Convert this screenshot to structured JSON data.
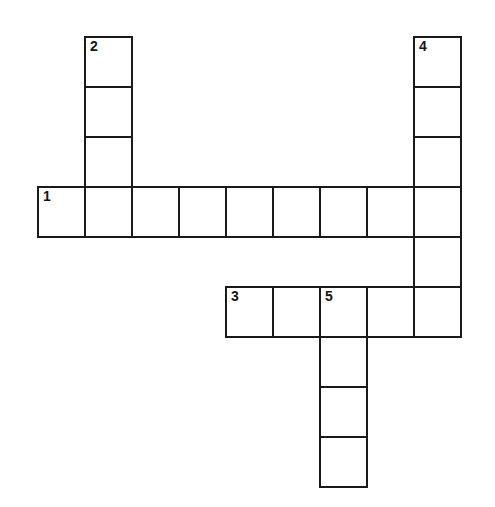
{
  "puzzle": {
    "title": "Crossword Grid",
    "background_color": "#ffffff",
    "cell_fill_color": "#ffffff",
    "cell_border_color": "#1a1a1a",
    "number_color": "#141414",
    "cell_width": 47,
    "cell_height": 50,
    "origin_x": 37,
    "origin_y": 36,
    "border_width": 2,
    "numbered_clues": [
      "1",
      "2",
      "3",
      "4",
      "5"
    ],
    "entries": [
      {
        "number": "1",
        "direction": "across",
        "length": 9,
        "start_col": 1,
        "start_row": 4
      },
      {
        "number": "2",
        "direction": "down",
        "length": 4,
        "start_col": 2,
        "start_row": 1
      },
      {
        "number": "3",
        "direction": "across",
        "length": 5,
        "start_col": 5,
        "start_row": 6
      },
      {
        "number": "4",
        "direction": "down",
        "length": 6,
        "start_col": 9,
        "start_row": 1
      },
      {
        "number": "5",
        "direction": "down",
        "length": 4,
        "start_col": 7,
        "start_row": 6
      }
    ],
    "cells": [
      {
        "id": "c-r1-c2",
        "row": 1,
        "col": 2,
        "number": "2",
        "letter": ""
      },
      {
        "id": "c-r1-c9",
        "row": 1,
        "col": 9,
        "number": "4",
        "letter": ""
      },
      {
        "id": "c-r2-c2",
        "row": 2,
        "col": 2,
        "number": "",
        "letter": ""
      },
      {
        "id": "c-r2-c9",
        "row": 2,
        "col": 9,
        "number": "",
        "letter": ""
      },
      {
        "id": "c-r3-c2",
        "row": 3,
        "col": 2,
        "number": "",
        "letter": ""
      },
      {
        "id": "c-r3-c9",
        "row": 3,
        "col": 9,
        "number": "",
        "letter": ""
      },
      {
        "id": "c-r4-c1",
        "row": 4,
        "col": 1,
        "number": "1",
        "letter": ""
      },
      {
        "id": "c-r4-c2",
        "row": 4,
        "col": 2,
        "number": "",
        "letter": ""
      },
      {
        "id": "c-r4-c3",
        "row": 4,
        "col": 3,
        "number": "",
        "letter": ""
      },
      {
        "id": "c-r4-c4",
        "row": 4,
        "col": 4,
        "number": "",
        "letter": ""
      },
      {
        "id": "c-r4-c5",
        "row": 4,
        "col": 5,
        "number": "",
        "letter": ""
      },
      {
        "id": "c-r4-c6",
        "row": 4,
        "col": 6,
        "number": "",
        "letter": ""
      },
      {
        "id": "c-r4-c7",
        "row": 4,
        "col": 7,
        "number": "",
        "letter": ""
      },
      {
        "id": "c-r4-c8",
        "row": 4,
        "col": 8,
        "number": "",
        "letter": ""
      },
      {
        "id": "c-r4-c9",
        "row": 4,
        "col": 9,
        "number": "",
        "letter": ""
      },
      {
        "id": "c-r5-c9",
        "row": 5,
        "col": 9,
        "number": "",
        "letter": ""
      },
      {
        "id": "c-r6-c5",
        "row": 6,
        "col": 5,
        "number": "3",
        "letter": ""
      },
      {
        "id": "c-r6-c6",
        "row": 6,
        "col": 6,
        "number": "",
        "letter": ""
      },
      {
        "id": "c-r6-c7",
        "row": 6,
        "col": 7,
        "number": "5",
        "letter": ""
      },
      {
        "id": "c-r6-c8",
        "row": 6,
        "col": 8,
        "number": "",
        "letter": ""
      },
      {
        "id": "c-r6-c9",
        "row": 6,
        "col": 9,
        "number": "",
        "letter": ""
      },
      {
        "id": "c-r7-c7",
        "row": 7,
        "col": 7,
        "number": "",
        "letter": ""
      },
      {
        "id": "c-r8-c7",
        "row": 8,
        "col": 7,
        "number": "",
        "letter": ""
      },
      {
        "id": "c-r9-c7",
        "row": 9,
        "col": 7,
        "number": "",
        "letter": ""
      }
    ]
  }
}
